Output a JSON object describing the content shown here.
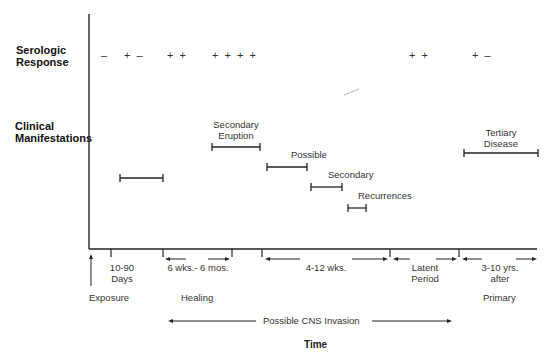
{
  "rows": {
    "serologic": "Serologic\nResponse",
    "serologic_line1": "Serologic",
    "serologic_line2": "Response",
    "clinical_line1": "Clinical",
    "clinical_line2": "Manifestations"
  },
  "serologic_marks": [
    {
      "id": "s1",
      "text": "–"
    },
    {
      "id": "s2",
      "text": "+ –"
    },
    {
      "id": "s3",
      "text": "+ +"
    },
    {
      "id": "s4",
      "text": "+ + + +"
    },
    {
      "id": "s5",
      "text": "+ +"
    },
    {
      "id": "s6",
      "text": "+ –"
    }
  ],
  "clinical_bars": [
    {
      "id": "primary",
      "label": ""
    },
    {
      "id": "secondary-eruption",
      "label_line1": "Secondary",
      "label_line2": "Eruption"
    },
    {
      "id": "possible",
      "label": "Possible"
    },
    {
      "id": "secondary",
      "label": "Secondary"
    },
    {
      "id": "recurrences",
      "label": "Recurrences"
    },
    {
      "id": "tertiary",
      "label_line1": "Tertiary",
      "label_line2": "Disease"
    }
  ],
  "timeline": {
    "intervals": [
      {
        "id": "incubation",
        "line1": "10-90",
        "line2": "Days"
      },
      {
        "id": "healing-interval",
        "line1": "6 wks.- 6 mos."
      },
      {
        "id": "secondary-interval",
        "line1": "4-12 wks."
      },
      {
        "id": "latent",
        "line1": "Latent",
        "line2": "Period"
      },
      {
        "id": "tertiary-interval",
        "line1": "3-10 yrs.",
        "line2": "after"
      }
    ],
    "events": {
      "exposure": "Exposure",
      "healing": "Healing",
      "primary": "Primary"
    },
    "cns": "Possible CNS Invasion",
    "axis_title": "Time"
  }
}
